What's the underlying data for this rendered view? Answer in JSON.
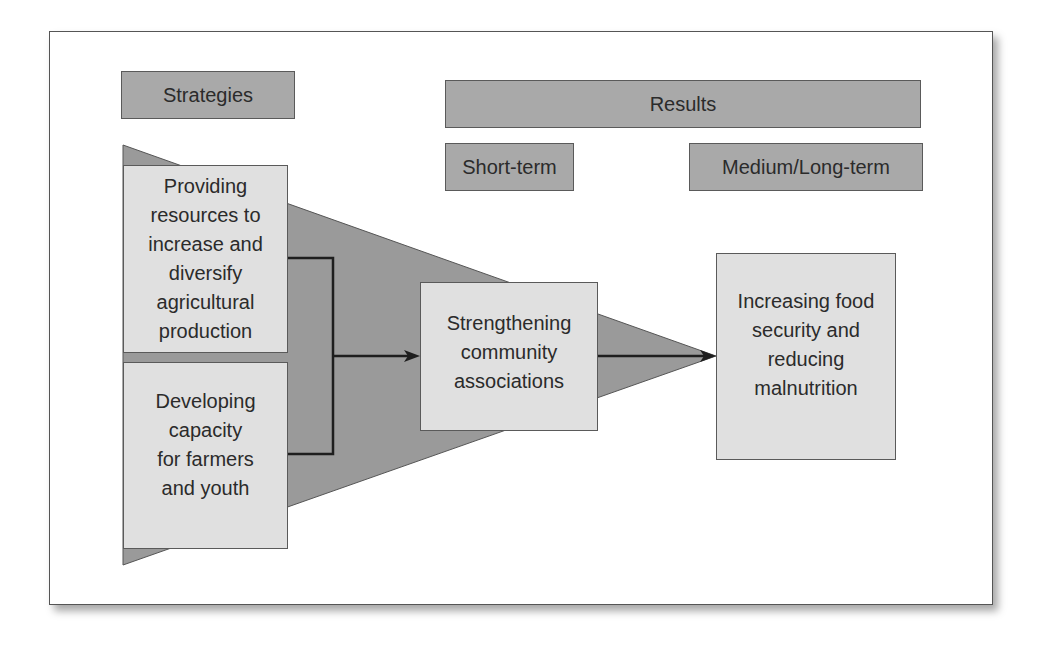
{
  "diagram": {
    "headers": {
      "strategies": "Strategies",
      "results": "Results",
      "short_term": "Short-term",
      "medium_long_term": "Medium/Long-term"
    },
    "strategies": [
      {
        "label": "Providing\nresources to\nincrease and\ndiversify\nagricultural\nproduction"
      },
      {
        "label": "Developing\ncapacity\nfor farmers\nand youth"
      }
    ],
    "short_term_result": {
      "label": "Strengthening\ncommunity\nassociations"
    },
    "long_term_result": {
      "label": "Increasing food\nsecurity and\nreducing\nmalnutrition"
    },
    "colors": {
      "header_fill": "#a9a9a9",
      "box_fill": "#e0e0e0",
      "triangle_fill": "#9a9a9a",
      "line": "#1e1e1e"
    }
  }
}
